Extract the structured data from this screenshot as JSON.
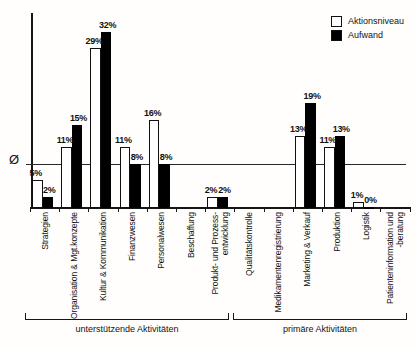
{
  "figure": {
    "background": "#fffefc",
    "ink": "#121212"
  },
  "chart_data": {
    "type": "bar",
    "title": "",
    "xlabel": "",
    "ylabel": "",
    "grid": false,
    "legend_position": "top-right",
    "value_suffix": "%",
    "ylim": [
      0,
      36
    ],
    "legend_items": [
      {
        "label": "Aktionsniveau",
        "swatch": "white"
      },
      {
        "label": "Aufwand",
        "swatch": "black"
      }
    ],
    "categories": [
      "Strategien",
      "Organisation & Mgt.konzepte",
      "Kultur & Kommunikation",
      "Finanzwesen",
      "Personalwesen",
      "Beschaffung",
      "Produkt- und Prozess-\nentwicklung",
      "Qualitätskontrolle",
      "Medikamentenregistrierung",
      "Marketing & Verkauf",
      "Produktion",
      "Logistik",
      "Patienteninformation und\n-beratung"
    ],
    "series": [
      {
        "name": "Aktionsniveau",
        "fill": "#ffffff",
        "values": [
          5,
          11,
          29,
          11,
          16,
          null,
          2,
          null,
          null,
          13,
          11,
          1,
          null
        ]
      },
      {
        "name": "Aufwand",
        "fill": "#000000",
        "values": [
          2,
          15,
          32,
          8,
          8,
          null,
          2,
          null,
          null,
          19,
          13,
          0,
          null
        ]
      }
    ],
    "average_line": {
      "symbol": "Ø",
      "approx_value_pct": 8
    },
    "groups": [
      {
        "label": "unterstützende Aktivitäten",
        "category_range": [
          0,
          6
        ]
      },
      {
        "label": "primäre Aktivitäten",
        "category_range": [
          7,
          12
        ]
      }
    ]
  }
}
